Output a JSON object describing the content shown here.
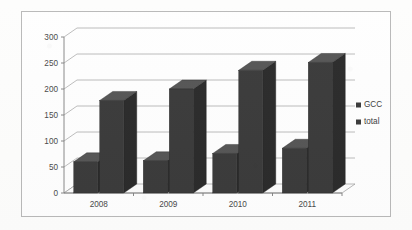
{
  "chart_data": {
    "type": "bar",
    "title": "",
    "subtitle": "",
    "xlabel": "",
    "ylabel": "",
    "categories": [
      "2008",
      "2009",
      "2010",
      "2011"
    ],
    "series": [
      {
        "name": "GCC",
        "values": [
          60,
          62,
          76,
          86
        ]
      },
      {
        "name": "total",
        "values": [
          178,
          200,
          236,
          251
        ]
      }
    ],
    "ylim": [
      0,
      300
    ],
    "ytick_step": 50,
    "ytick_labels": [
      "0",
      "50",
      "100",
      "150",
      "200",
      "250",
      "300"
    ],
    "grid": true,
    "grid_axis": "y",
    "legend_position": "right",
    "three_d": true,
    "bar_color": "#3b3b3b",
    "bar_top_color": "#565656",
    "bar_side_color": "#2b2b2b",
    "grid_color": "#8f8f8f",
    "axis_color": "#7d7d7d",
    "frame_color": "#b9b9b9",
    "background": "#fefefe",
    "text_color": "#4a4a4a"
  },
  "legend": {
    "items": [
      {
        "label": "GCC",
        "marker": "square-marker",
        "color": "#3b3b3b"
      },
      {
        "label": "total",
        "marker": "square-marker",
        "color": "#3b3b3b"
      }
    ]
  },
  "axes": {
    "y_ticks": [
      "300",
      "250",
      "200",
      "150",
      "100",
      "50",
      "0"
    ],
    "x_categories": [
      "2008",
      "2009",
      "2010",
      "2011"
    ]
  }
}
